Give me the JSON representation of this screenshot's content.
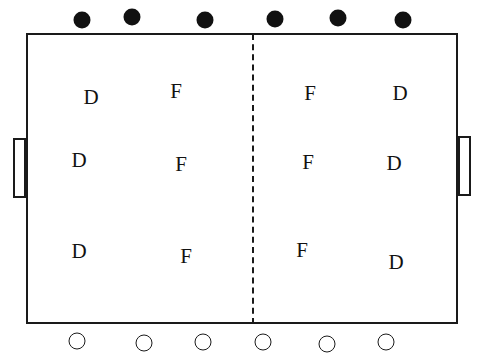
{
  "diagram": {
    "type": "playing-field-formation",
    "team_top": [
      {
        "x": 82,
        "y": 20
      },
      {
        "x": 132,
        "y": 17
      },
      {
        "x": 205,
        "y": 20
      },
      {
        "x": 275,
        "y": 19
      },
      {
        "x": 338,
        "y": 18
      },
      {
        "x": 403,
        "y": 20
      }
    ],
    "team_bottom": [
      {
        "x": 77,
        "y": 341
      },
      {
        "x": 144,
        "y": 343
      },
      {
        "x": 203,
        "y": 342
      },
      {
        "x": 263,
        "y": 342
      },
      {
        "x": 327,
        "y": 344
      },
      {
        "x": 386,
        "y": 342
      }
    ],
    "positions": [
      {
        "label": "D",
        "x": 91,
        "y": 97
      },
      {
        "label": "F",
        "x": 176,
        "y": 91
      },
      {
        "label": "F",
        "x": 310,
        "y": 93
      },
      {
        "label": "D",
        "x": 400,
        "y": 93
      },
      {
        "label": "D",
        "x": 79,
        "y": 160
      },
      {
        "label": "F",
        "x": 181,
        "y": 164
      },
      {
        "label": "F",
        "x": 308,
        "y": 162
      },
      {
        "label": "D",
        "x": 394,
        "y": 163
      },
      {
        "label": "D",
        "x": 79,
        "y": 251
      },
      {
        "label": "F",
        "x": 186,
        "y": 256
      },
      {
        "label": "F",
        "x": 302,
        "y": 250
      },
      {
        "label": "D",
        "x": 396,
        "y": 262
      }
    ]
  }
}
